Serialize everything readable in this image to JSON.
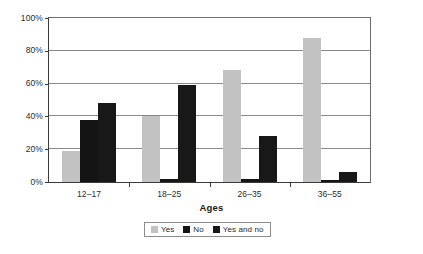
{
  "chart_data": {
    "type": "bar",
    "title": "",
    "xlabel": "Ages",
    "ylabel": "",
    "categories": [
      "12–17",
      "18–25",
      "26–35",
      "36–55"
    ],
    "series": [
      {
        "name": "Yes",
        "color": "#c2c2c2",
        "values": [
          19,
          40,
          68,
          88
        ]
      },
      {
        "name": "No",
        "color": "#141414",
        "values": [
          38,
          2,
          2,
          1
        ]
      },
      {
        "name": "Yes and no",
        "color": "#181818",
        "values": [
          48,
          59,
          28,
          6
        ]
      }
    ],
    "ylim": [
      0,
      100
    ],
    "yticks": [
      0,
      20,
      40,
      60,
      80,
      100
    ],
    "ytick_labels": [
      "0%",
      "20%",
      "40%",
      "60%",
      "80%",
      "100%"
    ],
    "grid": true,
    "legend_position": "bottom"
  },
  "axes": {
    "y": {
      "ticks": [
        {
          "label": "100%",
          "value": 100
        },
        {
          "label": "80%",
          "value": 80
        },
        {
          "label": "60%",
          "value": 60
        },
        {
          "label": "40%",
          "value": 40
        },
        {
          "label": "20%",
          "value": 20
        },
        {
          "label": "0%",
          "value": 0
        }
      ]
    },
    "x": {
      "title": "Ages",
      "ticks": [
        {
          "label": "12–17"
        },
        {
          "label": "18–25"
        },
        {
          "label": "26–35"
        },
        {
          "label": "36–55"
        }
      ]
    }
  },
  "legend": {
    "items": [
      {
        "label": "Yes",
        "color": "#c2c2c2"
      },
      {
        "label": "No",
        "color": "#141414"
      },
      {
        "label": "Yes and no",
        "color": "#181818"
      }
    ]
  }
}
